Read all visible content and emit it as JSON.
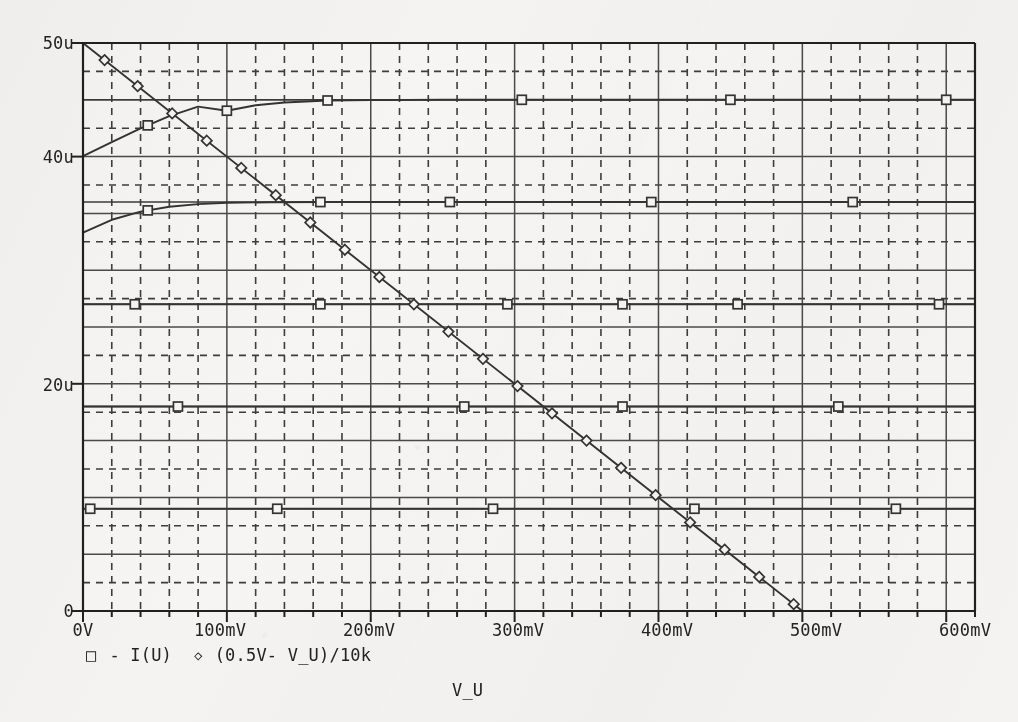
{
  "chart_data": {
    "type": "line",
    "title": "",
    "xlabel": "V_U",
    "ylabel": "",
    "xlim": [
      0,
      0.62
    ],
    "ylim": [
      0,
      5e-05
    ],
    "x_unit": "V",
    "y_unit": "A",
    "grid": "major solid + minor dashed",
    "legend_position": "below-axis",
    "x_tick_labels": [
      "0V",
      "100mV",
      "200mV",
      "300mV",
      "400mV",
      "500mV",
      "600mV"
    ],
    "x_tick_values": [
      0,
      0.1,
      0.2,
      0.3,
      0.4,
      0.5,
      0.6
    ],
    "x_minor_per_major": 5,
    "y_tick_labels": [
      "0",
      "20u",
      "40u",
      "50u"
    ],
    "y_tick_values": [
      0,
      2e-05,
      4e-05,
      5e-05
    ],
    "y_major_step": 5e-06,
    "y_minor_step": 2.5e-06,
    "legend": [
      {
        "marker": "square",
        "symbol": "□",
        "label": "- I(U)"
      },
      {
        "marker": "diamond",
        "symbol": "◇",
        "label": "(0.5V- V_U)/10k"
      }
    ],
    "annotations": [
      {
        "text": "Ev = 1000 lx",
        "x": 0.255,
        "y": 4.67e-05
      },
      {
        "text": "800 lx",
        "x": 0.265,
        "y": 3.76e-05
      },
      {
        "text": "600 lx",
        "x": 0.265,
        "y": 2.83e-05
      },
      {
        "text": "400 lx",
        "x": 0.265,
        "y": 1.88e-05
      },
      {
        "text": "200 lx",
        "x": 0.265,
        "y": 9.4e-06
      },
      {
        "text": "R = 10 k",
        "x": 0.435,
        "y": 1.12e-05
      }
    ],
    "series": [
      {
        "name": "- I(U) @ 1000 lx",
        "marker": "square",
        "illuminance_lx": 1000,
        "saturation_current_A": 4.5e-05,
        "points": [
          {
            "x": 0.0,
            "y": 4.005e-05
          },
          {
            "x": 0.02,
            "y": 4.128e-05
          },
          {
            "x": 0.04,
            "y": 4.248e-05
          },
          {
            "x": 0.06,
            "y": 4.356e-05
          },
          {
            "x": 0.08,
            "y": 4.44e-05
          },
          {
            "x": 0.1,
            "y": 4.404e-05
          },
          {
            "x": 0.12,
            "y": 4.452e-05
          },
          {
            "x": 0.14,
            "y": 4.476e-05
          },
          {
            "x": 0.17,
            "y": 4.494e-05
          },
          {
            "x": 0.2,
            "y": 4.497e-05
          },
          {
            "x": 0.25,
            "y": 4.5e-05
          },
          {
            "x": 0.31,
            "y": 4.5e-05
          },
          {
            "x": 0.36,
            "y": 4.5e-05
          },
          {
            "x": 0.45,
            "y": 4.5e-05
          },
          {
            "x": 0.52,
            "y": 4.5e-05
          },
          {
            "x": 0.6,
            "y": 4.5e-05
          },
          {
            "x": 0.62,
            "y": 4.5e-05
          }
        ],
        "marker_x": [
          0.045,
          0.1,
          0.17,
          0.305,
          0.45,
          0.6
        ]
      },
      {
        "name": "- I(U) @ 800 lx",
        "marker": "square",
        "illuminance_lx": 800,
        "saturation_current_A": 3.6e-05,
        "points": [
          {
            "x": 0.0,
            "y": 3.33e-05
          },
          {
            "x": 0.02,
            "y": 3.444e-05
          },
          {
            "x": 0.04,
            "y": 3.516e-05
          },
          {
            "x": 0.06,
            "y": 3.558e-05
          },
          {
            "x": 0.08,
            "y": 3.582e-05
          },
          {
            "x": 0.1,
            "y": 3.594e-05
          },
          {
            "x": 0.13,
            "y": 3.598e-05
          },
          {
            "x": 0.17,
            "y": 3.6e-05
          },
          {
            "x": 0.25,
            "y": 3.6e-05
          },
          {
            "x": 0.34,
            "y": 3.6e-05
          },
          {
            "x": 0.43,
            "y": 3.6e-05
          },
          {
            "x": 0.54,
            "y": 3.6e-05
          },
          {
            "x": 0.62,
            "y": 3.6e-05
          }
        ],
        "marker_x": [
          0.045,
          0.165,
          0.255,
          0.395,
          0.535
        ]
      },
      {
        "name": "- I(U) @ 600 lx",
        "marker": "square",
        "illuminance_lx": 600,
        "saturation_current_A": 2.7e-05,
        "points": [
          {
            "x": 0.0,
            "y": 2.7e-05
          },
          {
            "x": 0.1,
            "y": 2.7e-05
          },
          {
            "x": 0.2,
            "y": 2.7e-05
          },
          {
            "x": 0.3,
            "y": 2.7e-05
          },
          {
            "x": 0.4,
            "y": 2.7e-05
          },
          {
            "x": 0.5,
            "y": 2.7e-05
          },
          {
            "x": 0.62,
            "y": 2.7e-05
          }
        ],
        "marker_x": [
          0.036,
          0.165,
          0.295,
          0.375,
          0.455,
          0.595
        ]
      },
      {
        "name": "- I(U) @ 400 lx",
        "marker": "square",
        "illuminance_lx": 400,
        "saturation_current_A": 1.8e-05,
        "points": [
          {
            "x": 0.0,
            "y": 1.8e-05
          },
          {
            "x": 0.1,
            "y": 1.8e-05
          },
          {
            "x": 0.2,
            "y": 1.8e-05
          },
          {
            "x": 0.3,
            "y": 1.8e-05
          },
          {
            "x": 0.4,
            "y": 1.8e-05
          },
          {
            "x": 0.5,
            "y": 1.8e-05
          },
          {
            "x": 0.62,
            "y": 1.8e-05
          }
        ],
        "marker_x": [
          0.066,
          0.265,
          0.375,
          0.525
        ]
      },
      {
        "name": "- I(U) @ 200 lx",
        "marker": "square",
        "illuminance_lx": 200,
        "saturation_current_A": 9e-06,
        "points": [
          {
            "x": 0.0,
            "y": 9e-06
          },
          {
            "x": 0.1,
            "y": 9e-06
          },
          {
            "x": 0.2,
            "y": 9e-06
          },
          {
            "x": 0.3,
            "y": 9e-06
          },
          {
            "x": 0.4,
            "y": 9e-06
          },
          {
            "x": 0.5,
            "y": 9e-06
          },
          {
            "x": 0.62,
            "y": 9e-06
          }
        ],
        "marker_x": [
          0.005,
          0.135,
          0.285,
          0.425,
          0.565
        ]
      },
      {
        "name": "(0.5V- V_U)/10k",
        "marker": "diamond",
        "description": "10k load line",
        "x_intercept_V": 0.5,
        "y_intercept_A": 5e-05,
        "points": [
          {
            "x": 0.0,
            "y": 5e-05
          },
          {
            "x": 0.5,
            "y": 0.0
          }
        ],
        "marker_x": [
          0.015,
          0.038,
          0.062,
          0.086,
          0.11,
          0.134,
          0.158,
          0.182,
          0.206,
          0.23,
          0.254,
          0.278,
          0.302,
          0.326,
          0.35,
          0.374,
          0.398,
          0.422,
          0.446,
          0.47,
          0.494
        ]
      }
    ]
  },
  "axis": {
    "x_title": "V_U",
    "y_ticks": [
      {
        "label": "50u"
      },
      {
        "label": "40u"
      },
      {
        "label": "20u"
      },
      {
        "label": "0"
      }
    ],
    "x_ticks": [
      {
        "label": "0V"
      },
      {
        "label": "100mV"
      },
      {
        "label": "200mV"
      },
      {
        "label": "300mV"
      },
      {
        "label": "400mV"
      },
      {
        "label": "500mV"
      },
      {
        "label": "600mV"
      }
    ]
  },
  "legend": {
    "entry1_symbol": "□",
    "entry1_label": "- I(U)",
    "entry2_symbol": "◇",
    "entry2_label": "(0.5V- V_U)/10k"
  },
  "labels": {
    "ev1000": "Ev = 1000 lx",
    "lx800": "800 lx",
    "lx600": "600 lx",
    "lx400": "400 lx",
    "lx200": "200 lx",
    "resistor": "R = 10 k"
  },
  "colors": {
    "ink": "#232323",
    "grid_major": "#4a4a4a",
    "grid_minor": "#3d3d3d",
    "curve": "#333333",
    "paper": "#f4f3f1"
  }
}
